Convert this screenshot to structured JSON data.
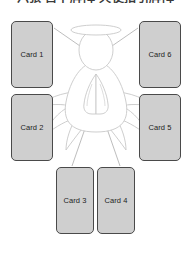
{
  "title": "六张 占卜牌阵 天使指引牌阵",
  "colors": {
    "background": "#ffffff",
    "card_fill": "#cfcfcf",
    "card_border": "#4a4a4a",
    "card_text": "#1d1d1d",
    "figure_stroke": "#c8c8c8",
    "connector_stroke": "#b5b5b5",
    "title_text": "#3a3a3a"
  },
  "figure": {
    "name": "angel",
    "parts": [
      "halo",
      "head",
      "body",
      "praying-hands",
      "left-wing",
      "right-wing"
    ]
  },
  "cards": [
    {
      "id": "card-1",
      "label": "Card 1",
      "x": 11,
      "y": 21,
      "w": 42,
      "h": 67
    },
    {
      "id": "card-2",
      "label": "Card 2",
      "x": 11,
      "y": 94,
      "w": 42,
      "h": 67
    },
    {
      "id": "card-3",
      "label": "Card 3",
      "x": 56,
      "y": 167,
      "w": 38,
      "h": 67
    },
    {
      "id": "card-4",
      "label": "Card 4",
      "x": 97,
      "y": 167,
      "w": 38,
      "h": 67
    },
    {
      "id": "card-5",
      "label": "Card 5",
      "x": 139,
      "y": 94,
      "w": 42,
      "h": 67
    },
    {
      "id": "card-6",
      "label": "Card 6",
      "x": 139,
      "y": 21,
      "w": 42,
      "h": 67
    }
  ],
  "connectors": [
    {
      "from": "angel",
      "to": "card-1"
    },
    {
      "from": "angel",
      "to": "card-2"
    },
    {
      "from": "angel",
      "to": "card-3"
    },
    {
      "from": "angel",
      "to": "card-4"
    },
    {
      "from": "angel",
      "to": "card-5"
    },
    {
      "from": "angel",
      "to": "card-6"
    }
  ]
}
